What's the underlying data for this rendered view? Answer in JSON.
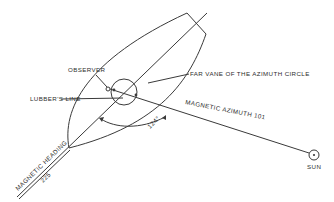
{
  "diagram": {
    "labels": {
      "observer": "OBSERVER",
      "lubbers_line": "LUBBER'S LINE",
      "far_vane": "FAR VANE OF THE AZIMUTH CIRCLE",
      "magnetic_azimuth": "MAGNETIC AZIMUTH 101",
      "magnetic_heading": "MAGNETIC HEADING",
      "heading_value": "225",
      "relative_bearing": "124°",
      "sun": "SUN"
    },
    "values": {
      "magnetic_heading_deg": 225,
      "magnetic_azimuth_deg": 101,
      "relative_bearing_deg": 124
    },
    "colors": {
      "line": "#3a3a3a",
      "text": "#2e2e2e",
      "background": "#ffffff"
    }
  }
}
